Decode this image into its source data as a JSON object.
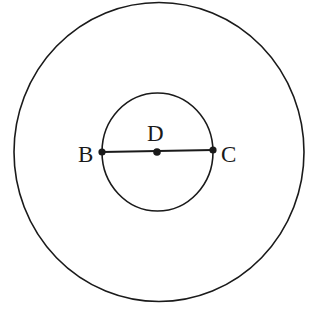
{
  "diagram": {
    "type": "concentric-circles-with-diameter",
    "stroke_color": "#1a1a1a",
    "background": "#ffffff",
    "outer_circle": {
      "cx": 159,
      "cy": 152,
      "rx": 145,
      "ry": 149.5
    },
    "inner_circle": {
      "cx": 157.5,
      "cy": 152,
      "rx": 55.5,
      "ry": 59
    },
    "segment": {
      "from": "B",
      "to": "C",
      "label": "BC"
    },
    "points": [
      {
        "id": "B",
        "label": "B",
        "x": 102,
        "y": 152
      },
      {
        "id": "D",
        "label": "D",
        "x": 157,
        "y": 152
      },
      {
        "id": "C",
        "label": "C",
        "x": 213,
        "y": 150
      }
    ],
    "labels": {
      "B": "B",
      "D": "D",
      "C": "C"
    }
  }
}
